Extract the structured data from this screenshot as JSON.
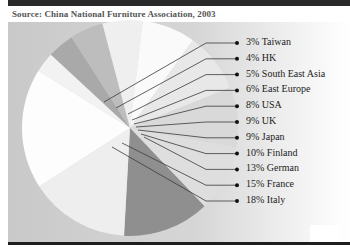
{
  "source": "Source: China National Furniture Association, 2003",
  "chart_data": {
    "type": "pie",
    "title": "",
    "source": "Source: China National Furniture Association, 2003",
    "unit": "%",
    "categories": [
      "Taiwan",
      "HK",
      "South East Asia",
      "East Europe",
      "USA",
      "UK",
      "Japan",
      "Finland",
      "German",
      "France",
      "Italy"
    ],
    "values": [
      3,
      4,
      5,
      6,
      8,
      9,
      9,
      10,
      13,
      15,
      18
    ],
    "labels": [
      "3% Taiwan",
      "4% HK",
      "5% South East Asia",
      "6% East Europe",
      "8% USA",
      "9% UK",
      "9% Japan",
      "10% Finland",
      "13% German",
      "15% France",
      "18% Italy"
    ],
    "legend_position": "right",
    "colors": {
      "Taiwan": "#f2f2f2",
      "HK": "#a9a9a9",
      "South East Asia": "#bdbdbd",
      "East Europe": "#efefef",
      "USA": "#fafafa",
      "UK": "#e8e8e8",
      "Japan": "#d9d9d9",
      "Finland": "#dedede",
      "German": "#8f8f8f",
      "France": "#eeeeee",
      "Italy": "#fdfdfd"
    }
  }
}
